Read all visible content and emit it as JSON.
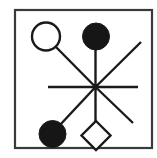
{
  "figure": {
    "canvas": {
      "width": 157,
      "height": 158
    },
    "colors": {
      "background": "#ffffff",
      "stroke": "#1a1a1a",
      "fill_solid": "#161616",
      "fill_open": "#ffffff",
      "frame_outer": "#3a3a3a",
      "frame_inner": "#ffffff"
    },
    "frame": {
      "label": "outer border frame",
      "x": 15,
      "y": 10,
      "width": 137,
      "height": 138,
      "stroke_width": 2.2
    },
    "hub": {
      "label": "central hub",
      "cx": 95.5,
      "cy": 87,
      "dot_radius": 3.0
    },
    "spokes": [
      {
        "name": "spoke-west",
        "x1": 95.5,
        "y1": 87,
        "x2": 48.0,
        "y2": 87.0,
        "stroke_width": 2.4
      },
      {
        "name": "spoke-east",
        "x1": 95.5,
        "y1": 87,
        "x2": 138.0,
        "y2": 87.0,
        "stroke_width": 2.4
      },
      {
        "name": "spoke-northwest",
        "x1": 95.5,
        "y1": 87,
        "x2": 53.0,
        "y2": 44.0,
        "stroke_width": 2.4
      },
      {
        "name": "spoke-northeast",
        "x1": 95.5,
        "y1": 87,
        "x2": 141.0,
        "y2": 42.0,
        "stroke_width": 2.4
      },
      {
        "name": "spoke-north",
        "x1": 95.5,
        "y1": 87,
        "x2": 95.5,
        "y2": 43.0,
        "stroke_width": 2.4
      },
      {
        "name": "spoke-south",
        "x1": 95.5,
        "y1": 87,
        "x2": 95.5,
        "y2": 124.0,
        "stroke_width": 2.4
      },
      {
        "name": "spoke-southwest",
        "x1": 95.5,
        "y1": 87,
        "x2": 59.0,
        "y2": 126.0,
        "stroke_width": 2.4
      },
      {
        "name": "spoke-southeast",
        "x1": 95.5,
        "y1": 87,
        "x2": 133.0,
        "y2": 123.0,
        "stroke_width": 2.4
      }
    ],
    "nodes": [
      {
        "name": "node-open-circle-upper-left",
        "shape": "circle",
        "style": "open",
        "cx": 46.0,
        "cy": 36.5,
        "radius": 14.0,
        "stroke_width": 2.4
      },
      {
        "name": "node-filled-circle-top",
        "shape": "circle",
        "style": "filled",
        "cx": 96.0,
        "cy": 36.5,
        "radius": 13.5,
        "stroke_width": 1.0
      },
      {
        "name": "node-filled-circle-lower-left",
        "shape": "circle",
        "style": "filled",
        "cx": 52.5,
        "cy": 134.0,
        "radius": 13.5,
        "stroke_width": 1.0
      },
      {
        "name": "node-open-diamond-bottom",
        "shape": "diamond",
        "style": "open",
        "cx": 96.0,
        "cy": 135.5,
        "radius": 14.5,
        "stroke_width": 2.4
      }
    ]
  }
}
